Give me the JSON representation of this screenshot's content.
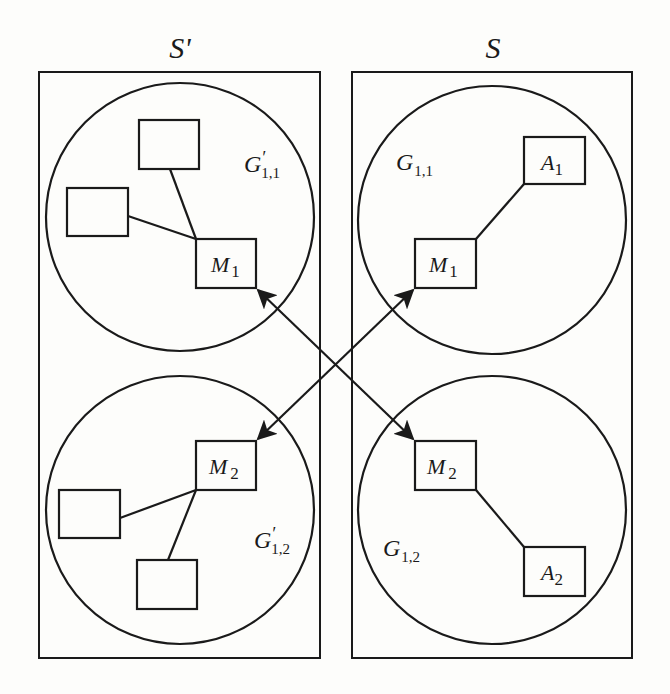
{
  "diagram": {
    "type": "mapping-between-system-partitions",
    "colors": {
      "stroke": "#1a1a1a",
      "background": "#fdfdfb"
    },
    "systems": [
      {
        "id": "S_prime",
        "title": "S'",
        "groups": [
          {
            "id": "G_prime_1_1",
            "label_main": "G",
            "label_prime": "′",
            "label_sub": "1,1",
            "nodes": [
              {
                "id": "M1_left",
                "label_main": "M",
                "label_sub": "1"
              },
              {
                "id": "unlabeled_1",
                "label_main": "",
                "label_sub": ""
              },
              {
                "id": "unlabeled_2",
                "label_main": "",
                "label_sub": ""
              }
            ],
            "edges": [
              [
                "M1_left",
                "unlabeled_1"
              ],
              [
                "M1_left",
                "unlabeled_2"
              ]
            ]
          },
          {
            "id": "G_prime_1_2",
            "label_main": "G",
            "label_prime": "′",
            "label_sub": "1,2",
            "nodes": [
              {
                "id": "M2_left",
                "label_main": "M",
                "label_sub": "2"
              },
              {
                "id": "unlabeled_3",
                "label_main": "",
                "label_sub": ""
              },
              {
                "id": "unlabeled_4",
                "label_main": "",
                "label_sub": ""
              }
            ],
            "edges": [
              [
                "M2_left",
                "unlabeled_3"
              ],
              [
                "M2_left",
                "unlabeled_4"
              ]
            ]
          }
        ]
      },
      {
        "id": "S",
        "title": "S",
        "groups": [
          {
            "id": "G_1_1",
            "label_main": "G",
            "label_prime": "",
            "label_sub": "1,1",
            "nodes": [
              {
                "id": "M1_right",
                "label_main": "M",
                "label_sub": "1"
              },
              {
                "id": "A1",
                "label_main": "A",
                "label_sub": "1"
              }
            ],
            "edges": [
              [
                "M1_right",
                "A1"
              ]
            ]
          },
          {
            "id": "G_1_2",
            "label_main": "G",
            "label_prime": "",
            "label_sub": "1,2",
            "nodes": [
              {
                "id": "M2_right",
                "label_main": "M",
                "label_sub": "2"
              },
              {
                "id": "A2",
                "label_main": "A",
                "label_sub": "2"
              }
            ],
            "edges": [
              [
                "M2_right",
                "A2"
              ]
            ]
          }
        ]
      }
    ],
    "cross_mappings": [
      {
        "from": "M1_left",
        "to": "M2_right",
        "bidirectional": true
      },
      {
        "from": "M2_left",
        "to": "M1_right",
        "bidirectional": true
      }
    ]
  }
}
